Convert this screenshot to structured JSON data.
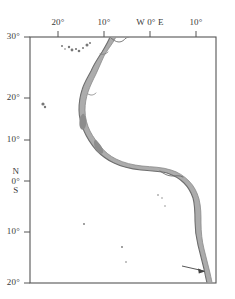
{
  "figure": {
    "type": "map",
    "region_name": "Eastern Atlantic and West African coast",
    "background_color": "#ffffff",
    "frame_color": "#555555",
    "coast_line_color": "#7a7a7a",
    "shelf_fill_color": "#9a9a9a",
    "island_color": "#777777",
    "annotation_arrow_color": "#444444"
  },
  "axes": {
    "top": {
      "orientation": "longitude",
      "ticks": [
        {
          "label": "20°",
          "x_px": 58,
          "value": -20
        },
        {
          "label": "10°",
          "x_px": 104,
          "value": -10
        },
        {
          "label": "W 0° E",
          "x_px": 150,
          "value": 0
        },
        {
          "label": "10°",
          "x_px": 196,
          "value": 10
        }
      ]
    },
    "left": {
      "orientation": "latitude",
      "ticks": [
        {
          "label": "30°",
          "y_px": 37,
          "value": 30,
          "stacked": false
        },
        {
          "label": "20°",
          "y_px": 98,
          "value": 20,
          "stacked": false
        },
        {
          "label": "10°",
          "y_px": 140,
          "value": 10,
          "stacked": false
        },
        {
          "label": "0°",
          "y_px": 181,
          "value": 0,
          "stacked": true,
          "above": "N",
          "below": "S"
        },
        {
          "label": "10°",
          "y_px": 232,
          "value": -10,
          "stacked": false
        },
        {
          "label": "20°",
          "y_px": 283,
          "value": -20,
          "stacked": false
        }
      ]
    }
  },
  "plot_frame": {
    "left_px": 30,
    "top_px": 37,
    "right_px": 216,
    "bottom_px": 283
  },
  "annotations": [
    {
      "name": "coast-arrow",
      "type": "arrow",
      "tail_x_px": 182,
      "tail_y_px": 266,
      "head_x_px": 205,
      "head_y_px": 271
    }
  ],
  "islands": [
    {
      "x_px": 62,
      "y_px": 46,
      "r": 1.0
    },
    {
      "x_px": 65,
      "y_px": 49,
      "r": 0.8
    },
    {
      "x_px": 69,
      "y_px": 47,
      "r": 1.2
    },
    {
      "x_px": 72,
      "y_px": 50,
      "r": 1.4
    },
    {
      "x_px": 76,
      "y_px": 49,
      "r": 1.1
    },
    {
      "x_px": 79,
      "y_px": 51,
      "r": 1.3
    },
    {
      "x_px": 83,
      "y_px": 48,
      "r": 1.0
    },
    {
      "x_px": 87,
      "y_px": 45,
      "r": 1.5
    },
    {
      "x_px": 90,
      "y_px": 43,
      "r": 1.0
    },
    {
      "x_px": 43,
      "y_px": 104,
      "r": 1.6
    },
    {
      "x_px": 45,
      "y_px": 107,
      "r": 1.2
    },
    {
      "x_px": 84,
      "y_px": 224,
      "r": 0.9
    },
    {
      "x_px": 122,
      "y_px": 247,
      "r": 0.9
    },
    {
      "x_px": 126,
      "y_px": 262,
      "r": 0.8
    },
    {
      "x_px": 158,
      "y_px": 195,
      "r": 0.8
    },
    {
      "x_px": 162,
      "y_px": 198,
      "r": 0.7
    },
    {
      "x_px": 165,
      "y_px": 206,
      "r": 0.7
    }
  ]
}
